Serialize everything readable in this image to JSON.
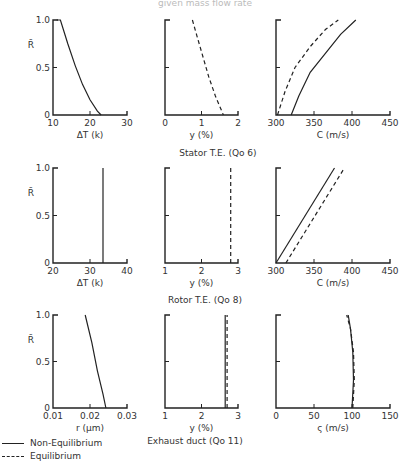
{
  "header": {
    "partial_title": "given mass flow rate"
  },
  "legend": [
    {
      "label": "Non-Equilibrium",
      "style": "solid"
    },
    {
      "label": "Equilibrium",
      "style": "dashed"
    }
  ],
  "rows": [
    {
      "caption": "Stator  T.E. (Qo 6)"
    },
    {
      "caption": "Rotor  T.E. (Qo 8)"
    },
    {
      "caption": "Exhaust  duct (Qo 11)"
    }
  ],
  "chart_data": [
    {
      "type": "line",
      "row": 1,
      "title": "",
      "xlabel": "ΔT (k)",
      "ylabel": "R̄",
      "xlim": [
        10,
        30
      ],
      "ylim": [
        0,
        1
      ],
      "xticks": [
        "10",
        "20",
        "30"
      ],
      "yticks": [
        "0",
        "0.5",
        "1.0"
      ],
      "series": [
        {
          "name": "Non-Equilibrium",
          "style": "solid",
          "points": [
            [
              11,
              1.0
            ],
            [
              12,
              1.0
            ],
            [
              14,
              0.75
            ],
            [
              16,
              0.52
            ],
            [
              18,
              0.32
            ],
            [
              20,
              0.16
            ],
            [
              22,
              0.04
            ],
            [
              23,
              0.0
            ]
          ]
        }
      ]
    },
    {
      "type": "line",
      "row": 1,
      "title": "",
      "xlabel": "y (%)",
      "ylabel": "",
      "xlim": [
        0,
        2
      ],
      "ylim": [
        0,
        1
      ],
      "xticks": [
        "0",
        "1",
        "2"
      ],
      "yticks": [],
      "series": [
        {
          "name": "Equilibrium",
          "style": "dashed",
          "points": [
            [
              0.75,
              1.0
            ],
            [
              0.9,
              0.8
            ],
            [
              1.05,
              0.6
            ],
            [
              1.2,
              0.4
            ],
            [
              1.38,
              0.2
            ],
            [
              1.6,
              0.0
            ]
          ]
        }
      ]
    },
    {
      "type": "line",
      "row": 1,
      "title": "",
      "xlabel": "C (m/s)",
      "ylabel": "",
      "xlim": [
        300,
        450
      ],
      "ylim": [
        0,
        1
      ],
      "xticks": [
        "300",
        "350",
        "400",
        "450"
      ],
      "yticks": [],
      "series": [
        {
          "name": "Non-Equilibrium",
          "style": "solid",
          "points": [
            [
              320,
              0.0
            ],
            [
              330,
              0.2
            ],
            [
              345,
              0.45
            ],
            [
              365,
              0.65
            ],
            [
              385,
              0.85
            ],
            [
              405,
              1.0
            ]
          ]
        },
        {
          "name": "Equilibrium",
          "style": "dashed",
          "points": [
            [
              302,
              0.0
            ],
            [
              312,
              0.25
            ],
            [
              325,
              0.5
            ],
            [
              345,
              0.72
            ],
            [
              365,
              0.9
            ],
            [
              382,
              1.0
            ]
          ]
        }
      ]
    },
    {
      "type": "line",
      "row": 2,
      "title": "",
      "xlabel": "ΔT (k)",
      "ylabel": "R̄",
      "xlim": [
        20,
        40
      ],
      "ylim": [
        0,
        1
      ],
      "xticks": [
        "20",
        "30",
        "40"
      ],
      "yticks": [
        "0",
        "0.5",
        "1.0"
      ],
      "series": [
        {
          "name": "Non-Equilibrium",
          "style": "solid",
          "points": [
            [
              33.5,
              0.0
            ],
            [
              33.5,
              1.0
            ]
          ]
        }
      ]
    },
    {
      "type": "line",
      "row": 2,
      "title": "",
      "xlabel": "y (%)",
      "ylabel": "",
      "xlim": [
        1,
        3
      ],
      "ylim": [
        0,
        1
      ],
      "xticks": [
        "1",
        "2",
        "3"
      ],
      "yticks": [],
      "series": [
        {
          "name": "Equilibrium",
          "style": "dashed",
          "points": [
            [
              2.8,
              0.0
            ],
            [
              2.8,
              1.0
            ]
          ]
        }
      ]
    },
    {
      "type": "line",
      "row": 2,
      "title": "",
      "xlabel": "C (m/s)",
      "ylabel": "",
      "xlim": [
        300,
        450
      ],
      "ylim": [
        0,
        1
      ],
      "xticks": [
        "300",
        "350",
        "400",
        "450"
      ],
      "yticks": [],
      "series": [
        {
          "name": "Non-Equilibrium",
          "style": "solid",
          "points": [
            [
              300,
              0.0
            ],
            [
              377,
              1.0
            ]
          ]
        },
        {
          "name": "Equilibrium",
          "style": "dashed",
          "points": [
            [
              313,
              0.0
            ],
            [
              390,
              1.0
            ]
          ]
        }
      ]
    },
    {
      "type": "line",
      "row": 3,
      "title": "",
      "xlabel": "r (μm)",
      "ylabel": "R̄",
      "xlim": [
        0.01,
        0.03
      ],
      "ylim": [
        0,
        1
      ],
      "xticks": [
        "0.01",
        "0.02",
        "0.03"
      ],
      "yticks": [
        "0",
        "0.5",
        "1.0"
      ],
      "series": [
        {
          "name": "Non-Equilibrium",
          "style": "solid",
          "points": [
            [
              0.0187,
              1.0
            ],
            [
              0.0205,
              0.7
            ],
            [
              0.022,
              0.4
            ],
            [
              0.0235,
              0.15
            ],
            [
              0.0243,
              0.0
            ]
          ]
        }
      ]
    },
    {
      "type": "line",
      "row": 3,
      "title": "",
      "xlabel": "y (%)",
      "ylabel": "",
      "xlim": [
        1,
        3
      ],
      "ylim": [
        0,
        1
      ],
      "xticks": [
        "1",
        "2",
        "3"
      ],
      "yticks": [],
      "series": [
        {
          "name": "Non-Equilibrium",
          "style": "solid",
          "points": [
            [
              2.65,
              0.0
            ],
            [
              2.65,
              1.0
            ]
          ]
        },
        {
          "name": "Equilibrium",
          "style": "dashed",
          "points": [
            [
              2.7,
              0.0
            ],
            [
              2.7,
              1.0
            ]
          ]
        }
      ]
    },
    {
      "type": "line",
      "row": 3,
      "title": "",
      "xlabel": "ς (m/s)",
      "ylabel": "",
      "xlim": [
        0,
        150
      ],
      "ylim": [
        0,
        1
      ],
      "xticks": [
        "0",
        "50",
        "100",
        "150"
      ],
      "yticks": [],
      "series": [
        {
          "name": "Non-Equilibrium",
          "style": "solid",
          "points": [
            [
              100,
              0.0
            ],
            [
              102,
              0.3
            ],
            [
              101,
              0.6
            ],
            [
              98,
              0.85
            ],
            [
              95,
              1.0
            ]
          ]
        },
        {
          "name": "Equilibrium",
          "style": "dashed",
          "points": [
            [
              101,
              0.0
            ],
            [
              103,
              0.3
            ],
            [
              102,
              0.6
            ],
            [
              98,
              0.85
            ],
            [
              93,
              1.0
            ]
          ]
        }
      ]
    }
  ]
}
